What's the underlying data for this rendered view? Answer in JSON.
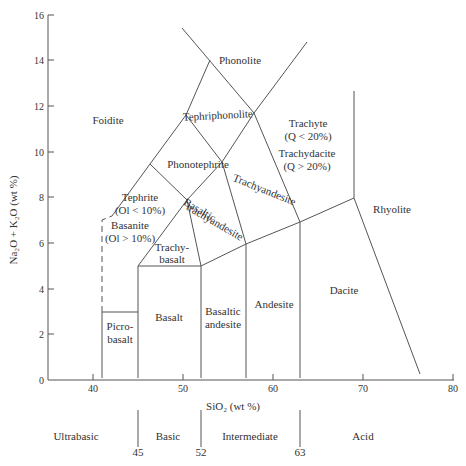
{
  "diagram": {
    "type": "TAS classification diagram",
    "axes": {
      "x": {
        "label": "SiO₂ (wt %)",
        "min": 35,
        "max": 80,
        "ticks": [
          40,
          50,
          60,
          70,
          80
        ]
      },
      "y": {
        "label": "Na₂O + K₂O (wt %)",
        "min": 0,
        "max": 16,
        "ticks": [
          0,
          2,
          4,
          6,
          8,
          10,
          12,
          14,
          16
        ]
      }
    },
    "fields": [
      {
        "id": "foidite",
        "lines": [
          "Foidite"
        ]
      },
      {
        "id": "phonolite",
        "lines": [
          "Phonolite"
        ]
      },
      {
        "id": "tephriphonolite",
        "lines": [
          "Tephriphonolite"
        ]
      },
      {
        "id": "phonotephrite",
        "lines": [
          "Phonotephrite"
        ]
      },
      {
        "id": "tephrite",
        "lines": [
          "Tephrite",
          "(Ol < 10%)"
        ]
      },
      {
        "id": "basanite",
        "lines": [
          "Basanite",
          "(Ol > 10%)"
        ]
      },
      {
        "id": "trachybasalt",
        "lines": [
          "Trachy-",
          "basalt"
        ]
      },
      {
        "id": "basaltic-trachyandesite",
        "lines": [
          "Basaltic",
          "trachyandesite"
        ]
      },
      {
        "id": "trachyandesite",
        "lines": [
          "Trachyandesite"
        ]
      },
      {
        "id": "trachyte",
        "lines": [
          "Trachyte",
          "(Q < 20%)"
        ]
      },
      {
        "id": "trachydacite",
        "lines": [
          "Trachydacite",
          "(Q > 20%)"
        ]
      },
      {
        "id": "rhyolite",
        "lines": [
          "Rhyolite"
        ]
      },
      {
        "id": "picrobasalt",
        "lines": [
          "Picro-",
          "basalt"
        ]
      },
      {
        "id": "basalt",
        "lines": [
          "Basalt"
        ]
      },
      {
        "id": "basaltic-andesite",
        "lines": [
          "Basaltic",
          "andesite"
        ]
      },
      {
        "id": "andesite",
        "lines": [
          "Andesite"
        ]
      },
      {
        "id": "dacite",
        "lines": [
          "Dacite"
        ]
      }
    ],
    "silica_classes": {
      "labels": [
        "Ultrabasic",
        "Basic",
        "Intermediate",
        "Acid"
      ],
      "boundaries": [
        "45",
        "52",
        "63"
      ]
    }
  }
}
